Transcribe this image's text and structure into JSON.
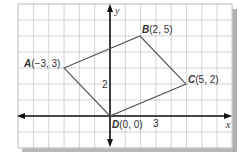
{
  "diagram": {
    "type": "coordinate-plane",
    "axes": {
      "x_label": "x",
      "y_label": "y"
    },
    "tick_labels": [
      {
        "axis": "y",
        "value": 2,
        "text": "2"
      },
      {
        "axis": "x",
        "value": 3,
        "text": "3"
      }
    ],
    "grid": {
      "x_range": [
        -6,
        8
      ],
      "y_range": [
        -2,
        7
      ]
    },
    "points": [
      {
        "name": "A",
        "coords": "(−3, 3)",
        "x": -3,
        "y": 3
      },
      {
        "name": "B",
        "coords": "(2, 5)",
        "x": 2,
        "y": 5
      },
      {
        "name": "C",
        "coords": "(5, 2)",
        "x": 5,
        "y": 2
      },
      {
        "name": "D",
        "coords": "(0, 0)",
        "x": 0,
        "y": 0
      }
    ],
    "polygon": [
      "A",
      "B",
      "C",
      "D"
    ],
    "colors": {
      "grid": "#c8c8c8",
      "polygon": "#555555",
      "axes": "#111111",
      "shadow": "#b0b0b0"
    }
  }
}
